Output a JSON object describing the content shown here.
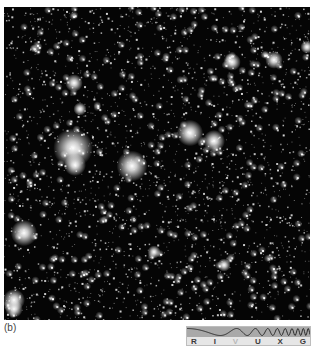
{
  "figure": {
    "panel_label": "(b)",
    "photo": {
      "description": "dense starfield",
      "background": "#050505",
      "star_color": "#ffffff",
      "random_star_count": 2600,
      "seed": 7,
      "bright_stars": [
        {
          "x": 69,
          "y": 141,
          "r": 9
        },
        {
          "x": 71,
          "y": 158,
          "r": 5
        },
        {
          "x": 128,
          "y": 159,
          "r": 7
        },
        {
          "x": 186,
          "y": 126,
          "r": 6
        },
        {
          "x": 210,
          "y": 134,
          "r": 5
        },
        {
          "x": 20,
          "y": 226,
          "r": 6
        },
        {
          "x": 10,
          "y": 293,
          "r": 5
        },
        {
          "x": 10,
          "y": 302,
          "r": 4
        },
        {
          "x": 70,
          "y": 76,
          "r": 4
        },
        {
          "x": 228,
          "y": 55,
          "r": 4
        },
        {
          "x": 270,
          "y": 53,
          "r": 4
        },
        {
          "x": 303,
          "y": 40,
          "r": 3
        },
        {
          "x": 76,
          "y": 102,
          "r": 3
        },
        {
          "x": 150,
          "y": 245,
          "r": 3
        },
        {
          "x": 220,
          "y": 258,
          "r": 3
        }
      ]
    },
    "spectrum_indicator": {
      "bands": [
        "R",
        "I",
        "V",
        "U",
        "X",
        "G"
      ],
      "active_band": "V",
      "wave_color": "#2b2b2b",
      "band_background": "#a9a9a9"
    }
  }
}
